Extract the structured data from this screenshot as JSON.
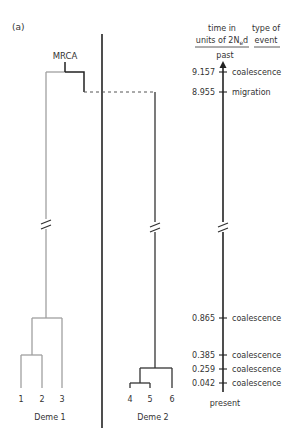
{
  "panel_label": "(a)",
  "mrca_label": "MRCA",
  "headers": {
    "time_line1": "time in",
    "time_line2_prefix": "units of 2N",
    "time_line2_sub": "e",
    "time_line2_suffix": "d",
    "event_line1": "type of",
    "event_line2": "event"
  },
  "axis": {
    "top_label": "past",
    "bottom_label": "present"
  },
  "events": [
    {
      "time": "9.157",
      "type": "coalescence"
    },
    {
      "time": "8.955",
      "type": "migration"
    },
    {
      "time": "0.865",
      "type": "coalescence"
    },
    {
      "time": "0.385",
      "type": "coalescence"
    },
    {
      "time": "0.259",
      "type": "coalescence"
    },
    {
      "time": "0.042",
      "type": "coalescence"
    }
  ],
  "demes": [
    {
      "label": "Deme 1",
      "leaves": [
        "1",
        "2",
        "3"
      ],
      "color": "#a0a0a0"
    },
    {
      "label": "Deme 2",
      "leaves": [
        "4",
        "5",
        "6"
      ],
      "color": "#333333"
    }
  ],
  "colors": {
    "deme1_lineage": "#a0a0a0",
    "deme2_lineage": "#333333",
    "divider": "#222222"
  }
}
